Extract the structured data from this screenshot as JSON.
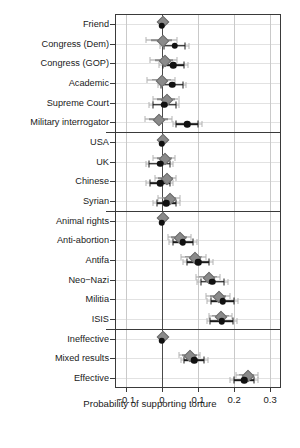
{
  "chart_data": {
    "type": "scatter",
    "title": "",
    "xlabel": "Probability of supporting torture",
    "ylabel": "",
    "xlim": [
      -0.13,
      0.33
    ],
    "xticks": [
      -0.1,
      0,
      0.1,
      0.2,
      0.3
    ],
    "xticklabels": [
      "−0.1",
      "0",
      "0.1",
      "0.2",
      "0.3"
    ],
    "grid": "vertical gridlines at ticks plus light horizontal gridlines per row",
    "legend": "none",
    "zero_reference_line": 0,
    "panel_dividers_after": [
      "Military interrogator",
      "Syrian",
      "ISIS"
    ],
    "series": [
      {
        "name": "Study 1 (gray diamonds)",
        "marker": "diamond",
        "color": "#8a8a8a"
      },
      {
        "name": "Study 2 (black circles)",
        "marker": "circle",
        "color": "#111111"
      }
    ],
    "categories": [
      "Friend",
      "Congress (Dem)",
      "Congress (GOP)",
      "Academic",
      "Supreme Court",
      "Military interrogator",
      "USA",
      "UK",
      "Chinese",
      "Syrian",
      "Animal rights",
      "Anti-abortion",
      "Antifa",
      "Neo−Nazi",
      "Militia",
      "ISIS",
      "Ineffective",
      "Mixed results",
      "Effective"
    ],
    "points": [
      {
        "category": "Friend",
        "reference": true,
        "gray": {
          "est": 0.0,
          "lo90": 0.0,
          "hi90": 0.0,
          "lo95": 0.0,
          "hi95": 0.0
        },
        "black": {
          "est": 0.0,
          "lo90": 0.0,
          "hi90": 0.0,
          "lo95": 0.0,
          "hi95": 0.0
        }
      },
      {
        "category": "Congress (Dem)",
        "reference": false,
        "gray": {
          "est": 0.0,
          "lo90": -0.03,
          "hi90": 0.028,
          "lo95": -0.045,
          "hi95": 0.042
        },
        "black": {
          "est": 0.035,
          "lo90": 0.005,
          "hi90": 0.065,
          "lo95": -0.005,
          "hi95": 0.075
        }
      },
      {
        "category": "Congress (GOP)",
        "reference": false,
        "gray": {
          "est": 0.005,
          "lo90": -0.02,
          "hi90": 0.03,
          "lo95": -0.032,
          "hi95": 0.043
        },
        "black": {
          "est": 0.032,
          "lo90": 0.002,
          "hi90": 0.062,
          "lo95": -0.008,
          "hi95": 0.072
        }
      },
      {
        "category": "Academic",
        "reference": false,
        "gray": {
          "est": -0.002,
          "lo90": -0.028,
          "hi90": 0.024,
          "lo95": -0.04,
          "hi95": 0.036
        },
        "black": {
          "est": 0.028,
          "lo90": -0.002,
          "hi90": 0.058,
          "lo95": -0.012,
          "hi95": 0.068
        }
      },
      {
        "category": "Supreme Court",
        "reference": false,
        "gray": {
          "est": 0.01,
          "lo90": -0.015,
          "hi90": 0.035,
          "lo95": -0.026,
          "hi95": 0.046
        },
        "black": {
          "est": 0.006,
          "lo90": -0.026,
          "hi90": 0.038,
          "lo95": -0.036,
          "hi95": 0.048
        }
      },
      {
        "category": "Military interrogator",
        "reference": false,
        "gray": {
          "est": -0.01,
          "lo90": -0.036,
          "hi90": 0.016,
          "lo95": -0.048,
          "hi95": 0.028
        },
        "black": {
          "est": 0.07,
          "lo90": 0.04,
          "hi90": 0.1,
          "lo95": 0.03,
          "hi95": 0.11
        }
      },
      {
        "category": "USA",
        "reference": true,
        "gray": {
          "est": 0.0,
          "lo90": 0.0,
          "hi90": 0.0,
          "lo95": 0.0,
          "hi95": 0.0
        },
        "black": {
          "est": 0.0,
          "lo90": 0.0,
          "hi90": 0.0,
          "lo95": 0.0,
          "hi95": 0.0
        }
      },
      {
        "category": "UK",
        "reference": false,
        "gray": {
          "est": 0.006,
          "lo90": -0.015,
          "hi90": 0.027,
          "lo95": -0.024,
          "hi95": 0.036
        },
        "black": {
          "est": -0.005,
          "lo90": -0.035,
          "hi90": 0.022,
          "lo95": -0.045,
          "hi95": 0.032
        }
      },
      {
        "category": "Chinese",
        "reference": false,
        "gray": {
          "est": 0.01,
          "lo90": -0.01,
          "hi90": 0.03,
          "lo95": -0.019,
          "hi95": 0.039
        },
        "black": {
          "est": -0.005,
          "lo90": -0.034,
          "hi90": 0.022,
          "lo95": -0.044,
          "hi95": 0.032
        }
      },
      {
        "category": "Syrian",
        "reference": false,
        "gray": {
          "est": 0.02,
          "lo90": 0.0,
          "hi90": 0.04,
          "lo95": -0.01,
          "hi95": 0.05
        },
        "black": {
          "est": 0.012,
          "lo90": -0.015,
          "hi90": 0.04,
          "lo95": -0.025,
          "hi95": 0.05
        }
      },
      {
        "category": "Animal rights",
        "reference": true,
        "gray": {
          "est": 0.0,
          "lo90": 0.0,
          "hi90": 0.0,
          "lo95": 0.0,
          "hi95": 0.0
        },
        "black": {
          "est": 0.0,
          "lo90": 0.0,
          "hi90": 0.0,
          "lo95": 0.0,
          "hi95": 0.0
        }
      },
      {
        "category": "Anti-abortion",
        "reference": false,
        "gray": {
          "est": 0.048,
          "lo90": 0.026,
          "hi90": 0.07,
          "lo95": 0.016,
          "hi95": 0.08
        },
        "black": {
          "est": 0.058,
          "lo90": 0.03,
          "hi90": 0.086,
          "lo95": 0.02,
          "hi95": 0.096
        }
      },
      {
        "category": "Antifa",
        "reference": false,
        "gray": {
          "est": 0.088,
          "lo90": 0.064,
          "hi90": 0.112,
          "lo95": 0.054,
          "hi95": 0.122
        },
        "black": {
          "est": 0.1,
          "lo90": 0.07,
          "hi90": 0.13,
          "lo95": 0.058,
          "hi95": 0.142
        }
      },
      {
        "category": "Neo−Nazi",
        "reference": false,
        "gray": {
          "est": 0.128,
          "lo90": 0.104,
          "hi90": 0.152,
          "lo95": 0.094,
          "hi95": 0.162
        },
        "black": {
          "est": 0.14,
          "lo90": 0.108,
          "hi90": 0.172,
          "lo95": 0.096,
          "hi95": 0.184
        }
      },
      {
        "category": "Militia",
        "reference": false,
        "gray": {
          "est": 0.155,
          "lo90": 0.132,
          "hi90": 0.178,
          "lo95": 0.122,
          "hi95": 0.188
        },
        "black": {
          "est": 0.168,
          "lo90": 0.135,
          "hi90": 0.2,
          "lo95": 0.124,
          "hi95": 0.212
        }
      },
      {
        "category": "ISIS",
        "reference": false,
        "gray": {
          "est": 0.162,
          "lo90": 0.14,
          "hi90": 0.186,
          "lo95": 0.13,
          "hi95": 0.195
        },
        "black": {
          "est": 0.166,
          "lo90": 0.134,
          "hi90": 0.198,
          "lo95": 0.124,
          "hi95": 0.208
        }
      },
      {
        "category": "Ineffective",
        "reference": true,
        "gray": {
          "est": 0.0,
          "lo90": 0.0,
          "hi90": 0.0,
          "lo95": 0.0,
          "hi95": 0.0
        },
        "black": {
          "est": 0.0,
          "lo90": 0.0,
          "hi90": 0.0,
          "lo95": 0.0,
          "hi95": 0.0
        }
      },
      {
        "category": "Mixed results",
        "reference": false,
        "gray": {
          "est": 0.076,
          "lo90": 0.056,
          "hi90": 0.096,
          "lo95": 0.046,
          "hi95": 0.106
        },
        "black": {
          "est": 0.09,
          "lo90": 0.062,
          "hi90": 0.118,
          "lo95": 0.052,
          "hi95": 0.128
        }
      },
      {
        "category": "Effective",
        "reference": false,
        "gray": {
          "est": 0.235,
          "lo90": 0.214,
          "hi90": 0.256,
          "lo95": 0.204,
          "hi95": 0.266
        },
        "black": {
          "est": 0.228,
          "lo90": 0.2,
          "hi90": 0.256,
          "lo95": 0.19,
          "hi95": 0.266
        }
      }
    ]
  }
}
